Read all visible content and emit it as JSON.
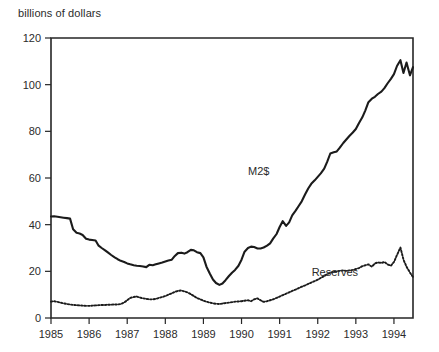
{
  "chart_data": {
    "type": "line",
    "title": "",
    "ylabel": "billions of dollars",
    "xlabel": "",
    "ylim": [
      0,
      120
    ],
    "xlim": [
      1985.0,
      1994.5
    ],
    "yticks": [
      0,
      20,
      40,
      60,
      80,
      100,
      120
    ],
    "xticks": [
      1985,
      1986,
      1987,
      1988,
      1989,
      1990,
      1991,
      1992,
      1993,
      1994
    ],
    "ytick_labels": [
      "0",
      "20",
      "40",
      "60",
      "80",
      "100",
      "120"
    ],
    "xtick_labels": [
      "1985",
      "1986",
      "1987",
      "1988",
      "1989",
      "1990",
      "1991",
      "1992",
      "1993",
      "1994"
    ],
    "grid": false,
    "legend": "inline-annotations",
    "annotations": [
      {
        "text": "M2$",
        "x": 1990.45,
        "y": 61.5
      },
      {
        "text": "Reserves",
        "x": 1992.45,
        "y": 18.0
      }
    ],
    "series": [
      {
        "name": "M2$",
        "style": "solid",
        "color": "#1b1b1b",
        "x": [
          1985.0,
          1985.08,
          1985.17,
          1985.25,
          1985.33,
          1985.42,
          1985.5,
          1985.58,
          1985.67,
          1985.75,
          1985.83,
          1985.92,
          1986.0,
          1986.08,
          1986.17,
          1986.25,
          1986.33,
          1986.42,
          1986.5,
          1986.58,
          1986.67,
          1986.75,
          1986.83,
          1986.92,
          1987.0,
          1987.08,
          1987.17,
          1987.25,
          1987.33,
          1987.42,
          1987.5,
          1987.58,
          1987.67,
          1987.75,
          1987.83,
          1987.92,
          1988.0,
          1988.08,
          1988.17,
          1988.25,
          1988.33,
          1988.42,
          1988.5,
          1988.58,
          1988.67,
          1988.75,
          1988.83,
          1988.92,
          1989.0,
          1989.08,
          1989.17,
          1989.25,
          1989.33,
          1989.42,
          1989.5,
          1989.58,
          1989.67,
          1989.75,
          1989.83,
          1989.92,
          1990.0,
          1990.08,
          1990.17,
          1990.25,
          1990.33,
          1990.42,
          1990.5,
          1990.58,
          1990.67,
          1990.75,
          1990.83,
          1990.92,
          1991.0,
          1991.08,
          1991.17,
          1991.25,
          1991.33,
          1991.42,
          1991.5,
          1991.58,
          1991.67,
          1991.75,
          1991.83,
          1991.92,
          1992.0,
          1992.08,
          1992.17,
          1992.25,
          1992.33,
          1992.42,
          1992.5,
          1992.58,
          1992.67,
          1992.75,
          1992.83,
          1992.92,
          1993.0,
          1993.08,
          1993.17,
          1993.25,
          1993.33,
          1993.42,
          1993.5,
          1993.58,
          1993.67,
          1993.75,
          1993.83,
          1993.92,
          1994.0,
          1994.08,
          1994.17,
          1994.25,
          1994.33,
          1994.42,
          1994.5
        ],
        "y": [
          43.5,
          43.6,
          43.4,
          43.2,
          43.0,
          42.8,
          42.6,
          38.0,
          36.5,
          36.2,
          35.6,
          34.0,
          33.6,
          33.4,
          33.2,
          31.0,
          30.0,
          29.0,
          28.0,
          27.0,
          26.0,
          25.2,
          24.5,
          24.0,
          23.4,
          23.0,
          22.6,
          22.4,
          22.3,
          22.1,
          21.8,
          22.8,
          22.6,
          23.0,
          23.4,
          23.8,
          24.2,
          24.6,
          25.0,
          26.6,
          27.8,
          28.0,
          27.6,
          28.2,
          29.2,
          29.0,
          28.2,
          27.8,
          26.0,
          22.0,
          19.0,
          16.5,
          15.0,
          14.2,
          14.8,
          16.2,
          18.0,
          19.4,
          20.6,
          22.4,
          25.0,
          28.4,
          30.0,
          30.6,
          30.4,
          29.8,
          29.8,
          30.2,
          31.0,
          32.0,
          34.0,
          36.0,
          39.0,
          41.5,
          39.5,
          41.0,
          44.0,
          46.0,
          48.0,
          50.0,
          53.0,
          55.5,
          57.5,
          59.0,
          60.5,
          62.0,
          64.0,
          67.0,
          70.5,
          71.0,
          71.4,
          73.0,
          75.0,
          76.5,
          78.0,
          79.5,
          81.0,
          83.5,
          86.0,
          89.0,
          92.5,
          94.0,
          94.8,
          96.0,
          97.0,
          98.5,
          100.5,
          102.5,
          104.5,
          108.0,
          110.5,
          105.0,
          109.5,
          104.0,
          107.5
        ]
      },
      {
        "name": "Reserves",
        "style": "dotted",
        "color": "#1b1b1b",
        "x": [
          1985.0,
          1985.08,
          1985.17,
          1985.25,
          1985.33,
          1985.42,
          1985.5,
          1985.58,
          1985.67,
          1985.75,
          1985.83,
          1985.92,
          1986.0,
          1986.08,
          1986.17,
          1986.25,
          1986.33,
          1986.42,
          1986.5,
          1986.58,
          1986.67,
          1986.75,
          1986.83,
          1986.92,
          1987.0,
          1987.08,
          1987.17,
          1987.25,
          1987.33,
          1987.42,
          1987.5,
          1987.58,
          1987.67,
          1987.75,
          1987.83,
          1987.92,
          1988.0,
          1988.08,
          1988.17,
          1988.25,
          1988.33,
          1988.42,
          1988.5,
          1988.58,
          1988.67,
          1988.75,
          1988.83,
          1988.92,
          1989.0,
          1989.08,
          1989.17,
          1989.25,
          1989.33,
          1989.42,
          1989.5,
          1989.58,
          1989.67,
          1989.75,
          1989.83,
          1989.92,
          1990.0,
          1990.08,
          1990.17,
          1990.25,
          1990.33,
          1990.42,
          1990.5,
          1990.58,
          1990.67,
          1990.75,
          1990.83,
          1990.92,
          1991.0,
          1991.08,
          1991.17,
          1991.25,
          1991.33,
          1991.42,
          1991.5,
          1991.58,
          1991.67,
          1991.75,
          1991.83,
          1991.92,
          1992.0,
          1992.08,
          1992.17,
          1992.25,
          1992.33,
          1992.42,
          1992.5,
          1992.58,
          1992.67,
          1992.75,
          1992.83,
          1992.92,
          1993.0,
          1993.08,
          1993.17,
          1993.25,
          1993.33,
          1993.42,
          1993.5,
          1993.58,
          1993.67,
          1993.75,
          1993.83,
          1993.92,
          1994.0,
          1994.08,
          1994.17,
          1994.25,
          1994.33,
          1994.42,
          1994.5
        ],
        "y": [
          7.0,
          7.2,
          6.9,
          6.6,
          6.3,
          6.0,
          5.8,
          5.6,
          5.5,
          5.4,
          5.3,
          5.2,
          5.2,
          5.3,
          5.4,
          5.5,
          5.6,
          5.6,
          5.7,
          5.7,
          5.8,
          5.8,
          6.0,
          6.6,
          7.6,
          8.6,
          9.0,
          9.2,
          8.8,
          8.4,
          8.2,
          8.0,
          8.0,
          8.2,
          8.6,
          9.0,
          9.4,
          10.0,
          10.6,
          11.2,
          11.6,
          11.8,
          11.4,
          11.0,
          10.2,
          9.4,
          8.6,
          8.0,
          7.4,
          7.0,
          6.6,
          6.3,
          6.1,
          6.0,
          6.2,
          6.4,
          6.6,
          6.8,
          7.0,
          7.1,
          7.2,
          7.4,
          7.6,
          7.2,
          8.0,
          8.4,
          7.6,
          6.9,
          7.2,
          7.6,
          8.0,
          8.6,
          9.2,
          9.8,
          10.4,
          11.0,
          11.6,
          12.2,
          12.8,
          13.4,
          14.0,
          14.6,
          15.2,
          15.8,
          16.4,
          17.2,
          18.0,
          18.8,
          19.4,
          19.8,
          20.0,
          20.2,
          20.4,
          20.2,
          20.4,
          20.6,
          21.0,
          21.4,
          22.2,
          22.6,
          23.0,
          22.0,
          23.4,
          23.8,
          23.6,
          24.0,
          23.0,
          22.4,
          24.0,
          27.0,
          30.2,
          25.0,
          22.0,
          19.5,
          17.5
        ]
      }
    ]
  },
  "axes": {
    "ylabel_caption": "billions of dollars"
  }
}
